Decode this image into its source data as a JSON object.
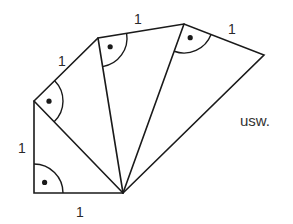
{
  "diagram": {
    "title": "",
    "colors": {
      "line": "#1a1a1a",
      "text": "#2a2a2a",
      "background": "#ffffff"
    },
    "apex": {
      "x": 123,
      "y": 193
    },
    "vertices": [
      {
        "id": "A",
        "x": 34,
        "y": 193
      },
      {
        "id": "B",
        "x": 34,
        "y": 101
      },
      {
        "id": "C",
        "x": 98,
        "y": 38
      },
      {
        "id": "D",
        "x": 184,
        "y": 24
      },
      {
        "id": "E",
        "x": 264,
        "y": 55
      }
    ],
    "triangles": [
      {
        "name": "triangle-1",
        "points": [
          "O",
          "A",
          "B"
        ],
        "right_angle_at": "A"
      },
      {
        "name": "triangle-2",
        "points": [
          "O",
          "B",
          "C"
        ],
        "right_angle_at": "B"
      },
      {
        "name": "triangle-3",
        "points": [
          "O",
          "C",
          "D"
        ],
        "right_angle_at": "C"
      },
      {
        "name": "triangle-4",
        "points": [
          "O",
          "D",
          "E"
        ],
        "right_angle_at": "D"
      }
    ],
    "labels": [
      {
        "name": "label-bottom-leg",
        "text": "1",
        "x": 76,
        "y": 217
      },
      {
        "name": "label-left-leg",
        "text": "1",
        "x": 18,
        "y": 153
      },
      {
        "name": "label-leg-bc",
        "text": "1",
        "x": 58,
        "y": 66
      },
      {
        "name": "label-leg-cd",
        "text": "1",
        "x": 134,
        "y": 24
      },
      {
        "name": "label-leg-de",
        "text": "1",
        "x": 228,
        "y": 34
      }
    ],
    "continuation_text": {
      "text": "usw.",
      "x": 240,
      "y": 126
    }
  }
}
